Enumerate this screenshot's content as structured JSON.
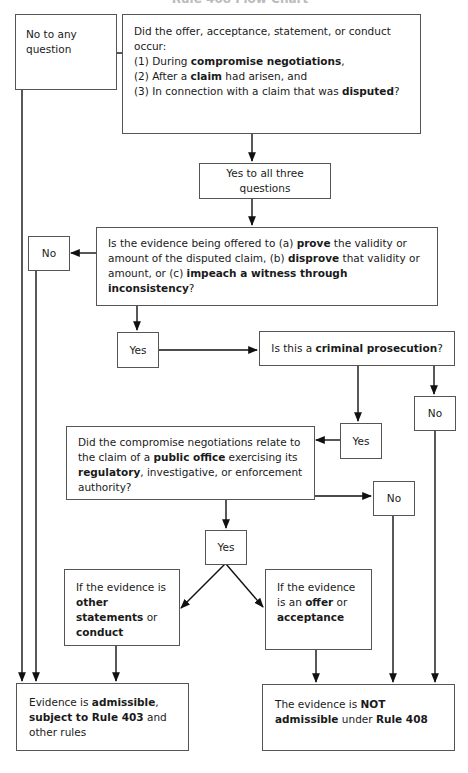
{
  "header": {
    "title": "Rule 408 Flow Chart"
  },
  "nodes": {
    "no_any": {
      "label": "No to any question"
    },
    "q1": {
      "intro": "Did the offer, acceptance, statement, or conduct occur:",
      "items": [
        {
          "pre": "(1) During ",
          "bold": "compromise negotiations",
          "post": ","
        },
        {
          "pre": "(2) After a ",
          "bold": "claim",
          "post": " had arisen, and"
        },
        {
          "pre": "(3) In connection with a claim that was ",
          "bold": "disputed",
          "post": "?"
        }
      ]
    },
    "yes_all": {
      "label": "Yes to all three questions"
    },
    "q2": {
      "t1": "Is the evidence being offered to (a) ",
      "b1": "prove",
      "t2": " the validity or amount of the disputed claim, (b) ",
      "b2": "disprove",
      "t3": " that validity or amount, or (c) ",
      "b3": "impeach a witness through inconsistency",
      "t4": "?"
    },
    "no_q2": {
      "label": "No"
    },
    "yes_q2": {
      "label": "Yes"
    },
    "q3": {
      "t1": "Is this a ",
      "b1": "criminal prosecution",
      "t2": "?"
    },
    "no_q3": {
      "label": "No"
    },
    "yes_q3": {
      "label": "Yes"
    },
    "q4": {
      "t1": "Did the compromise negotiations relate to the claim of a ",
      "b1": "public office",
      "t2": " exercising its ",
      "b2": "regulatory",
      "t3": ", investigative, or enforcement authority?"
    },
    "no_q4": {
      "label": "No"
    },
    "yes_q4": {
      "label": "Yes"
    },
    "other": {
      "t1": "If the evidence is ",
      "b1": "other statements",
      "t2": " or ",
      "b2": "conduct"
    },
    "offer": {
      "t1": "If the evidence is an ",
      "b1": "offer",
      "t2": " or ",
      "b2": "acceptance"
    },
    "admissible": {
      "t1": "Evidence is ",
      "b1": "admissible",
      "t2": ", ",
      "b2": "subject to Rule 403",
      "t3": " and other rules"
    },
    "not_admissible": {
      "t1": "The evidence is ",
      "b1": "NOT admissible",
      "t2": " under ",
      "b2": "Rule 408"
    }
  }
}
